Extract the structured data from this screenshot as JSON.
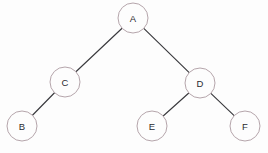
{
  "diagram": {
    "type": "tree",
    "background_color": "#fdfdfd",
    "node_stroke_color": "#b5a5ab",
    "node_fill_color": "#fdfdfd",
    "edge_color": "#3a3a3e",
    "label_color": "#2b2b2f",
    "node_radius": 15,
    "nodes": [
      {
        "id": "A",
        "label": "A",
        "x": 133,
        "y": 18
      },
      {
        "id": "C",
        "label": "C",
        "x": 65,
        "y": 82
      },
      {
        "id": "D",
        "label": "D",
        "x": 200,
        "y": 83
      },
      {
        "id": "B",
        "label": "B",
        "x": 22,
        "y": 126
      },
      {
        "id": "E",
        "label": "E",
        "x": 152,
        "y": 126
      },
      {
        "id": "F",
        "label": "F",
        "x": 245,
        "y": 126
      }
    ],
    "edges": [
      {
        "from": "A",
        "to": "C"
      },
      {
        "from": "A",
        "to": "D"
      },
      {
        "from": "C",
        "to": "B"
      },
      {
        "from": "D",
        "to": "E"
      },
      {
        "from": "D",
        "to": "F"
      }
    ]
  }
}
